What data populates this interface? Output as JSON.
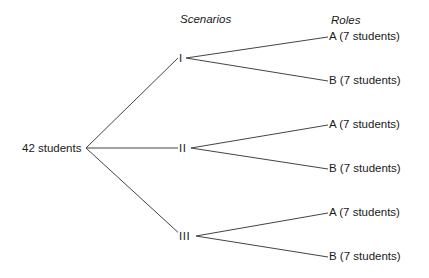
{
  "headers": {
    "scenarios": "Scenarios",
    "roles": "Roles"
  },
  "root": {
    "label": "42 students",
    "x": 86,
    "y": 148
  },
  "scenarios": [
    {
      "label": "I",
      "x": 181,
      "y": 58,
      "roles": [
        {
          "label": "A  (7 students)",
          "y": 36
        },
        {
          "label": "B  (7 students)",
          "y": 80
        }
      ]
    },
    {
      "label": "II",
      "x": 183,
      "y": 148,
      "roles": [
        {
          "label": "A  (7 students)",
          "y": 124
        },
        {
          "label": "B  (7 students)",
          "y": 168
        }
      ]
    },
    {
      "label": "III",
      "x": 185,
      "y": 236,
      "roles": [
        {
          "label": "A  (7 students)",
          "y": 212
        },
        {
          "label": "B  (7 students)",
          "y": 256
        }
      ]
    }
  ],
  "leaf_x": 329,
  "colors": {
    "line": "#444444",
    "text": "#1a1a1a"
  }
}
